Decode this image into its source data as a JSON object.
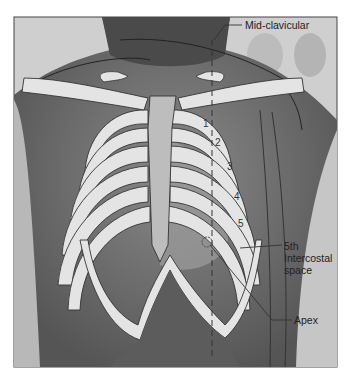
{
  "figure": {
    "labels": {
      "mid_clavicular": "Mid-clavicular",
      "intercostal_line1": "5th",
      "intercostal_line2": "Intercostal",
      "intercostal_line3": "space",
      "apex": "Apex"
    },
    "rib_numbers": [
      "1",
      "2",
      "3",
      "4",
      "5"
    ],
    "colors": {
      "background": "#ffffff",
      "frame_bg": "#c9c9c9",
      "skin_dark": "#6a6a6a",
      "bone": "#e6e6e6",
      "intercostal": "#8a8a8a",
      "outline": "#333333"
    }
  }
}
